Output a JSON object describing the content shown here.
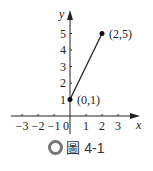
{
  "chart_data": {
    "type": "line",
    "title": "",
    "xlabel": "x",
    "ylabel": "y",
    "xlim": [
      -3.7,
      4.2
    ],
    "ylim": [
      -1.2,
      5.9
    ],
    "x_ticks": [
      -3,
      -2,
      -1,
      0,
      1,
      2,
      3
    ],
    "x_tick_labels": [
      "−3",
      "−2",
      "−1",
      "0",
      "1",
      "2",
      "3"
    ],
    "y_ticks": [
      1,
      2,
      3,
      4,
      5
    ],
    "y_tick_labels": [
      "1",
      "2",
      "3",
      "4",
      "5"
    ],
    "grid": false,
    "series": [
      {
        "name": "segment",
        "points": [
          {
            "x": 0,
            "y": 1
          },
          {
            "x": 2,
            "y": 5
          }
        ]
      }
    ],
    "annotations": [
      {
        "x": 0,
        "y": 1,
        "text": "(0,1)"
      },
      {
        "x": 2,
        "y": 5,
        "text": "(2,5)"
      }
    ]
  },
  "caption": {
    "icon": "circle-icon",
    "text": "圖 4-1"
  }
}
